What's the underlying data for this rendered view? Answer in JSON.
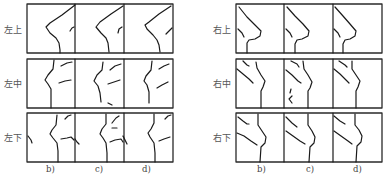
{
  "left_group": {
    "rows": [
      {
        "label": "左上"
      },
      {
        "label": "左中"
      },
      {
        "label": "左下"
      }
    ],
    "columns": [
      "b)",
      "c)",
      "d)"
    ]
  },
  "right_group": {
    "rows": [
      {
        "label": "右上"
      },
      {
        "label": "右中"
      },
      {
        "label": "右下"
      }
    ],
    "columns": [
      "b)",
      "c)",
      "d)"
    ]
  },
  "colors": {
    "line": "#1a1a1a",
    "border": "#2a2a2a",
    "background": "#ffffff"
  }
}
